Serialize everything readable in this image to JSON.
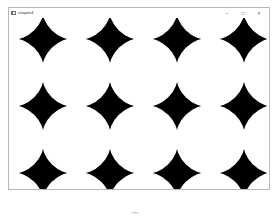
{
  "window": {
    "title": "chapter4",
    "icon": "app-window-icon",
    "controls": {
      "minimize": {
        "icon": "minimize-icon",
        "glyph": "–"
      },
      "maximize": {
        "icon": "maximize-icon",
        "glyph": "□"
      },
      "close": {
        "icon": "close-icon",
        "glyph": "×"
      }
    }
  },
  "canvas": {
    "background_color": "#000000",
    "circle_color": "#ffffff",
    "pattern": "tiled white circles on black producing 4-point black stars",
    "grid_spacing_px": 67,
    "star_columns_x": [
      34,
      101,
      168,
      235
    ],
    "star_rows_y": [
      21,
      86,
      151
    ],
    "circle_radius_px": 35
  },
  "taskbar": {
    "icon": "taskbar-app-icon"
  }
}
